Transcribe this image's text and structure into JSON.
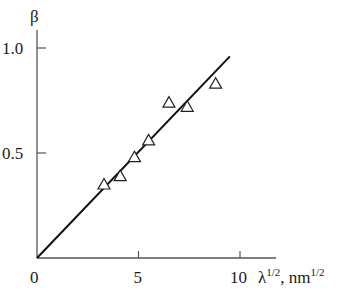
{
  "chart_data": {
    "type": "scatter",
    "title": "",
    "xlabel": "λ^1/2, nm^1/2",
    "ylabel": "β",
    "xlabel_parts": {
      "base": "λ",
      "base_sup": "1/2",
      "unit": ", nm",
      "unit_sup": "1/2"
    },
    "xlim": [
      0,
      11.8
    ],
    "ylim": [
      0,
      1.1
    ],
    "x_ticks": [
      0,
      5,
      10
    ],
    "x_tick_labels": [
      "0",
      "5",
      "10"
    ],
    "y_ticks": [
      0.5,
      1.0
    ],
    "y_tick_labels": [
      "0.5",
      "1.0"
    ],
    "grid": false,
    "legend": null,
    "series": [
      {
        "name": "measured",
        "marker": "open-triangle",
        "x": [
          3.3,
          4.1,
          4.8,
          5.5,
          6.5,
          7.4,
          8.8
        ],
        "y": [
          0.35,
          0.39,
          0.48,
          0.56,
          0.74,
          0.72,
          0.83
        ]
      },
      {
        "name": "linear fit",
        "style": "solid-line",
        "x": [
          0,
          9.5
        ],
        "y": [
          0,
          0.96
        ]
      }
    ],
    "colors": {
      "axis": "#555555",
      "line": "#111111",
      "marker": "#222222"
    }
  }
}
